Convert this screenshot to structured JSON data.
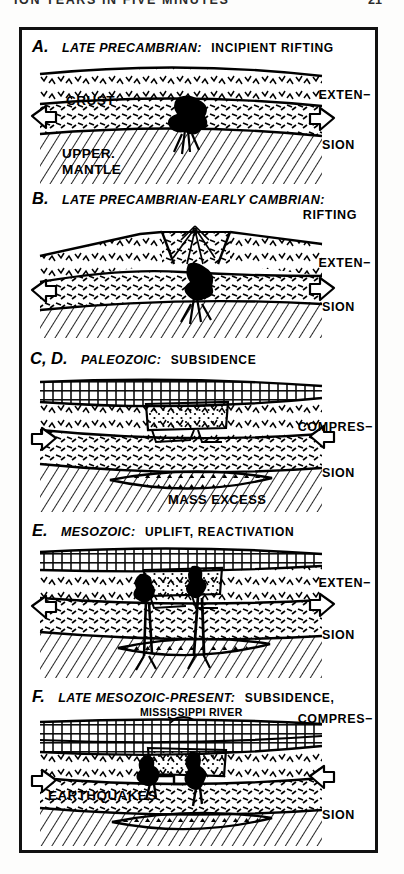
{
  "header": {
    "running_title": "ION YEARS IN FIVE MINUTES",
    "page_number": "21"
  },
  "figure": {
    "panels": [
      {
        "letter": "A.",
        "era": "LATE PRECAMBRIAN:",
        "event": "INCIPIENT RIFTING",
        "event_line2": "",
        "stress_top": "EXTEN−",
        "stress_bottom": "SION",
        "stress_type": "extension",
        "inner_labels": [
          "CRUST",
          "UPPER.",
          "MANTLE"
        ]
      },
      {
        "letter": "B.",
        "era": "LATE PRECAMBRIAN-EARLY CAMBRIAN:",
        "event": "",
        "event_line2": "RIFTING",
        "stress_top": "EXTEN−",
        "stress_bottom": "SION",
        "stress_type": "extension",
        "inner_labels": []
      },
      {
        "letter": "C, D.",
        "era": "PALEOZOIC:",
        "event": "SUBSIDENCE",
        "event_line2": "",
        "stress_top": "COMPRES−",
        "stress_bottom": "SION",
        "stress_type": "compression",
        "inner_labels": [
          "MASS EXCESS"
        ]
      },
      {
        "letter": "E.",
        "era": "MESOZOIC:",
        "event": "UPLIFT, REACTIVATION",
        "event_line2": "",
        "stress_top": "EXTEN−",
        "stress_bottom": "SION",
        "stress_type": "extension",
        "inner_labels": []
      },
      {
        "letter": "F.",
        "era": "LATE MESOZOIC-PRESENT:",
        "event": "SUBSIDENCE,",
        "event_line2": "COMPRES−",
        "stress_top": "",
        "stress_bottom": "SION",
        "stress_type": "compression",
        "inner_labels": [
          "MISSISSIPPI RIVER",
          "EARTHQUAKES"
        ]
      }
    ]
  },
  "colors": {
    "ink": "#000000",
    "paper": "#ffffff",
    "page": "#fdfdfc"
  }
}
